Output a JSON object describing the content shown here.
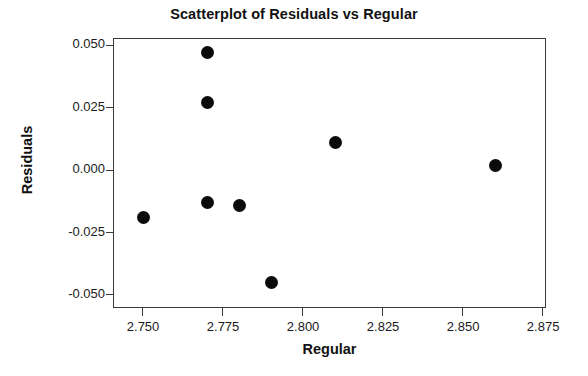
{
  "chart_data": {
    "type": "scatter",
    "title": "Scatterplot of Residuals vs Regular",
    "xlabel": "Regular",
    "ylabel": "Residuals",
    "xlim": [
      2.7406,
      2.8759
    ],
    "ylim": [
      -0.0551,
      0.053
    ],
    "grid": false,
    "legend": null,
    "marker": {
      "shape": "circle",
      "color": "#0b0b0b",
      "size_px": 13
    },
    "xticks": [
      2.75,
      2.775,
      2.8,
      2.825,
      2.85,
      2.875
    ],
    "xtick_labels": [
      "2.750",
      "2.775",
      "2.800",
      "2.825",
      "2.850",
      "2.875"
    ],
    "yticks": [
      0.05,
      0.025,
      0.0,
      -0.025,
      -0.05
    ],
    "ytick_labels": [
      "0.050",
      "0.025",
      "0.000",
      "-0.025",
      "-0.050"
    ],
    "x": [
      2.75,
      2.77,
      2.77,
      2.77,
      2.78,
      2.79,
      2.81,
      2.86
    ],
    "y": [
      -0.019,
      0.047,
      0.027,
      -0.013,
      -0.014,
      -0.045,
      0.011,
      0.002
    ],
    "points": [
      {
        "x": 2.75,
        "y": -0.019
      },
      {
        "x": 2.77,
        "y": 0.047
      },
      {
        "x": 2.77,
        "y": 0.027
      },
      {
        "x": 2.77,
        "y": -0.013
      },
      {
        "x": 2.78,
        "y": -0.014
      },
      {
        "x": 2.79,
        "y": -0.045
      },
      {
        "x": 2.81,
        "y": 0.011
      },
      {
        "x": 2.86,
        "y": 0.002
      }
    ]
  }
}
